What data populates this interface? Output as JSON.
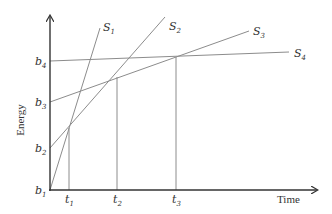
{
  "diagram": {
    "type": "energy-time line diagram",
    "colors": {
      "axis": "#333333",
      "line": "#8c8c8c",
      "text": "#333333",
      "background": "#ffffff"
    },
    "axes": {
      "x_label": "Time",
      "y_label": "Energy"
    },
    "y_ticks": [
      {
        "base": "b",
        "sub": "1"
      },
      {
        "base": "b",
        "sub": "2"
      },
      {
        "base": "b",
        "sub": "3"
      },
      {
        "base": "b",
        "sub": "4"
      }
    ],
    "x_ticks": [
      {
        "base": "t",
        "sub": "1"
      },
      {
        "base": "t",
        "sub": "2"
      },
      {
        "base": "t",
        "sub": "3"
      }
    ],
    "lines": [
      {
        "base": "S",
        "sub": "1",
        "intercept": "b1"
      },
      {
        "base": "S",
        "sub": "2",
        "intercept": "b2"
      },
      {
        "base": "S",
        "sub": "3",
        "intercept": "b3"
      },
      {
        "base": "S",
        "sub": "4",
        "intercept": "b4"
      }
    ],
    "intersections": [
      {
        "at": "t1",
        "lines": [
          "S1",
          "S2"
        ]
      },
      {
        "at": "t2",
        "lines": [
          "S2",
          "S3"
        ]
      },
      {
        "at": "t3",
        "lines": [
          "S3",
          "S4"
        ]
      }
    ]
  }
}
